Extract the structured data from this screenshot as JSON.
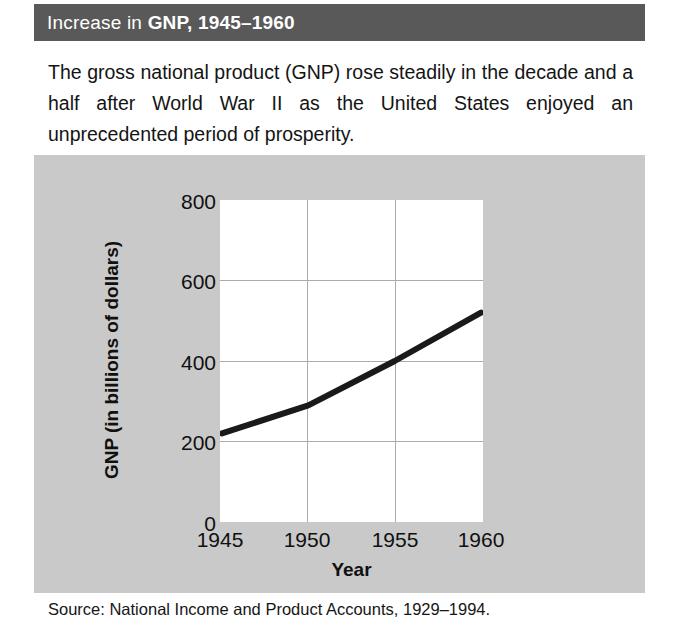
{
  "figure": {
    "title_lead": "Increase in",
    "title_emphasis": "GNP, 1945–1960",
    "caption": "The gross national product (GNP) rose steadily in the decade and a half after World War II as the United States enjoyed an unprecedented period of prosperity.",
    "source": "Source: National Income and Product Accounts, 1929–1994.",
    "colors": {
      "title_bar": "#595959",
      "title_text": "#ffffff",
      "panel_background": "#c9c9c9",
      "plot_background": "#ffffff",
      "gridline": "#aaaaaa",
      "line": "#1a1a1a"
    }
  },
  "chart_data": {
    "type": "line",
    "title": "Increase in GNP, 1945–1960",
    "xlabel": "Year",
    "ylabel": "GNP (in billions of dollars)",
    "xlim": [
      1945,
      1960
    ],
    "ylim": [
      0,
      800
    ],
    "xticks": [
      "1945",
      "1950",
      "1955",
      "1960"
    ],
    "xtick_values": [
      1945,
      1950,
      1955,
      1960
    ],
    "yticks": [
      "0",
      "200",
      "400",
      "600",
      "800"
    ],
    "ytick_values": [
      0,
      200,
      400,
      600,
      800
    ],
    "grid": "both",
    "legend": "none",
    "x": [
      1945,
      1950,
      1955,
      1960
    ],
    "values": [
      220,
      290,
      400,
      520
    ],
    "series": [
      {
        "name": "GNP",
        "values": [
          220,
          290,
          400,
          520
        ]
      }
    ]
  }
}
